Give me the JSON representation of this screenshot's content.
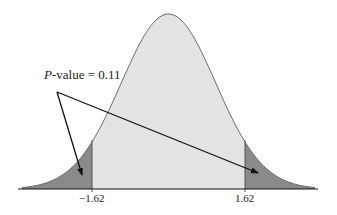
{
  "chart_data": {
    "type": "area",
    "title": "",
    "distribution": "standard normal",
    "critical_values": [
      -1.62,
      1.62
    ],
    "tick_labels": [
      "-1.62",
      "1.62"
    ],
    "shaded_regions": [
      "left tail (z < -1.62)",
      "right tail (z > 1.62)"
    ],
    "annotation": {
      "label_italic": "P",
      "label_rest": "-value = 0.11",
      "value": 0.11,
      "arrows_to": [
        "left tail",
        "right tail"
      ]
    },
    "xlabel": "",
    "ylabel": "",
    "grid": false
  },
  "labels": {
    "left_tick": "−1.62",
    "right_tick": "1.62",
    "annot_p": "P",
    "annot_rest": "-value = 0.11"
  },
  "colors": {
    "body_fill": "#e3e3e3",
    "tail_fill": "#8a8a8a",
    "curve": "#6a6a6a",
    "axis": "#111111"
  }
}
